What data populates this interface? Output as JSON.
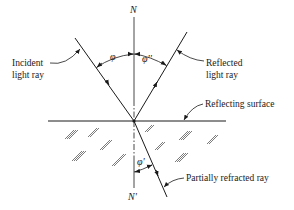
{
  "figure": {
    "type": "reflection-refraction-diagram",
    "labels": {
      "normal_top": "N",
      "normal_bottom": "N'",
      "incident_ray": [
        "Incident",
        "light ray"
      ],
      "reflected_ray": [
        "Reflected",
        "light ray"
      ],
      "surface": "Reflecting surface",
      "refracted_ray": "Partially refracted ray",
      "angle_incidence": "φ",
      "angle_reflection": "φ''",
      "angle_refraction": "φ'"
    },
    "colors": {
      "ink": "#1a1a1a",
      "background": "#ffffff"
    }
  }
}
